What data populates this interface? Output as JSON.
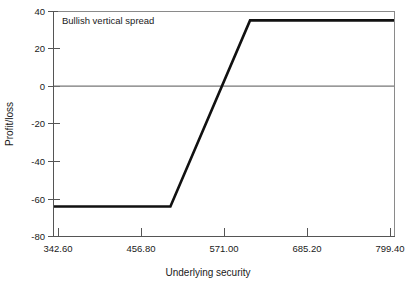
{
  "chart_data": {
    "type": "line",
    "title": "Bullish vertical spread",
    "xlabel": "Underlying security",
    "ylabel": "Profit/loss",
    "xlim": [
      342.6,
      799.4
    ],
    "ylim": [
      -80,
      40
    ],
    "xticks": [
      "342.60",
      "456.80",
      "571.00",
      "685.20",
      "799.40"
    ],
    "xtick_values": [
      342.6,
      456.8,
      571.0,
      685.2,
      799.4
    ],
    "yticks": [
      "40",
      "20",
      "0",
      "-20",
      "-40",
      "-60",
      "-80"
    ],
    "ytick_values": [
      40,
      20,
      0,
      -20,
      -40,
      -60,
      -80
    ],
    "grid": false,
    "legend": null,
    "zero_line": 0,
    "series": [
      {
        "name": "Profit/loss at expiration",
        "x": [
          342.6,
          499.0,
          606.0,
          799.4
        ],
        "values": [
          -64,
          -64,
          35,
          35
        ]
      }
    ],
    "annotations": [
      {
        "text": "Bullish vertical spread",
        "x": 370.0,
        "y": 33
      }
    ],
    "max_profit": 35,
    "max_loss": -64,
    "breakeven": 571.0
  },
  "colors": {
    "background": "#ffffff",
    "axis": "#555555",
    "data_line": "#111111",
    "zero_line": "#777777",
    "text": "#1a1a1a"
  }
}
